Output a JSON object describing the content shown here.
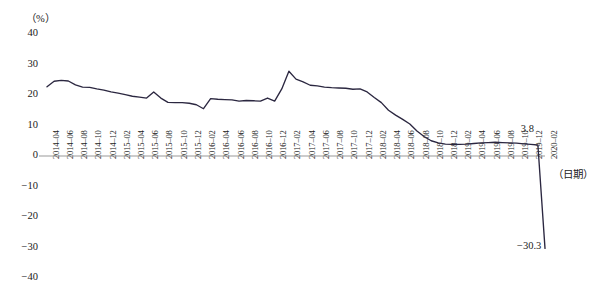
{
  "chart_data": {
    "type": "line",
    "title": "",
    "unit_label": "（%）",
    "xlabel": "（日期）",
    "ylabel": "",
    "ylim": [
      -40,
      40
    ],
    "yticks": [
      40,
      30,
      20,
      10,
      0,
      -10,
      -20,
      -30,
      -40
    ],
    "ytick_labels": [
      "40",
      "30",
      "20",
      "10",
      "0",
      "-10",
      "-20",
      "-30",
      "-40"
    ],
    "grid": false,
    "legend": "none",
    "line_color": "#2b2740",
    "axis_color": "#9a9a9a",
    "categories": [
      "2014-04",
      "2014-05",
      "2014-06",
      "2014-07",
      "2014-08",
      "2014-09",
      "2014-10",
      "2014-11",
      "2014-12",
      "2015-01",
      "2015-02",
      "2015-03",
      "2015-04",
      "2015-05",
      "2015-06",
      "2015-07",
      "2015-08",
      "2015-09",
      "2015-10",
      "2015-11",
      "2015-12",
      "2016-01",
      "2016-02",
      "2016-03",
      "2016-04",
      "2016-05",
      "2016-06",
      "2016-07",
      "2016-08",
      "2016-09",
      "2016-10",
      "2016-11",
      "2016-12",
      "2017-01",
      "2017-02",
      "2017-03",
      "2017-04",
      "2017-05",
      "2017-06",
      "2017-07",
      "2017-08",
      "2017-09",
      "2017-10",
      "2017-11",
      "2017-12",
      "2018-01",
      "2018-02",
      "2018-03",
      "2018-04",
      "2018-05",
      "2018-06",
      "2018-07",
      "2018-08",
      "2018-09",
      "2018-10",
      "2018-11",
      "2018-12",
      "2019-01",
      "2019-02",
      "2019-03",
      "2019-04",
      "2019-05",
      "2019-06",
      "2019-07",
      "2019-08",
      "2019-09",
      "2019-10",
      "2019-11",
      "2019-12",
      "2020-01",
      "2020-02"
    ],
    "xtick_labels": [
      "2014-04",
      "2014-06",
      "2014-08",
      "2014-10",
      "2014-12",
      "2015-02",
      "2015-04",
      "2015-06",
      "2015-08",
      "2015-10",
      "2015-12",
      "2016-02",
      "2016-04",
      "2016-06",
      "2016-08",
      "2016-10",
      "2016-12",
      "2017-02",
      "2017-04",
      "2017-06",
      "2017-08",
      "2017-10",
      "2017-12",
      "2018-02",
      "2018-04",
      "2018-06",
      "2018-08",
      "2018-10",
      "2018-12",
      "2019-02",
      "2019-04",
      "2019-06",
      "2019-08",
      "2019-10",
      "2019-12",
      "2020-02"
    ],
    "values": [
      22.7,
      24.5,
      24.8,
      24.6,
      23.3,
      22.6,
      22.5,
      22.0,
      21.6,
      21.0,
      20.6,
      20.1,
      19.6,
      19.3,
      19.0,
      21.0,
      19.0,
      17.6,
      17.5,
      17.5,
      17.3,
      16.8,
      15.5,
      18.8,
      18.6,
      18.5,
      18.4,
      18.0,
      18.2,
      18.1,
      18.0,
      19.0,
      18.0,
      22.0,
      27.8,
      25.2,
      24.3,
      23.2,
      23.0,
      22.6,
      22.4,
      22.3,
      22.2,
      21.9,
      22.0,
      21.0,
      19.2,
      17.5,
      15.0,
      13.4,
      12.0,
      10.5,
      8.2,
      6.4,
      5.0,
      4.3,
      3.9,
      3.8,
      3.8,
      3.9,
      4.1,
      4.3,
      4.4,
      4.5,
      4.4,
      4.3,
      4.2,
      4.0,
      3.8,
      3.6,
      -30.3
    ],
    "annotations": [
      {
        "label": "3.8",
        "value": 3.8,
        "category": "2019-12"
      },
      {
        "label": "-30.3",
        "value": -30.3,
        "category": "2020-02"
      }
    ]
  }
}
